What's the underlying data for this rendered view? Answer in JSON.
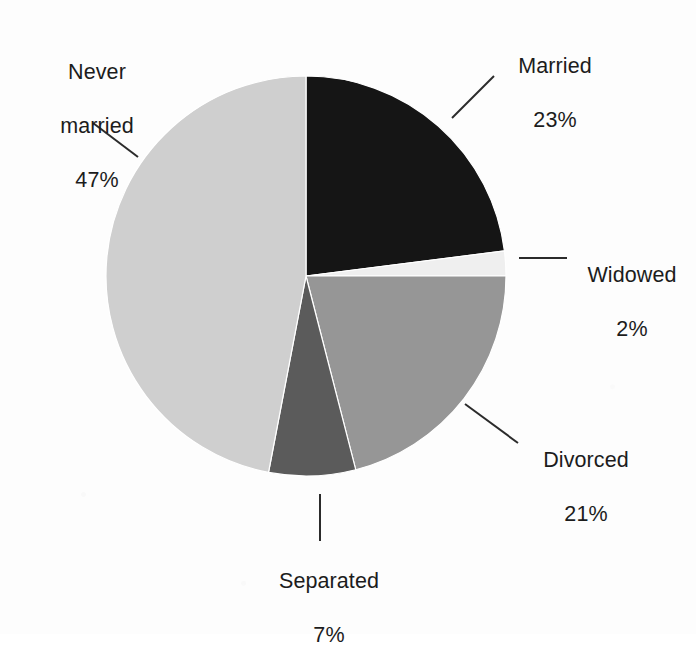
{
  "figure": {
    "background_color": "#fdfdfd",
    "text_color": "#1c1c1c",
    "leader_line_color": "#2b2b2b"
  },
  "chart_data": {
    "type": "pie",
    "title": "",
    "subtitle": "",
    "xlabel": "",
    "ylabel": "",
    "legend_position": "none",
    "labels_position": "outside-callouts",
    "grid": false,
    "start_angle_deg": 0,
    "direction": "clockwise",
    "center": {
      "x": 306,
      "y": 276
    },
    "radius": 200,
    "categories": [
      "Married",
      "Widowed",
      "Divorced",
      "Separated",
      "Never married"
    ],
    "values": [
      23,
      2,
      21,
      7,
      47
    ],
    "units": "%",
    "total": 100,
    "slices": [
      {
        "name": "Married",
        "label": "Married",
        "value": 23,
        "value_text": "23%",
        "color": "#151515",
        "start_deg": 0,
        "end_deg": 82.8,
        "leader": {
          "x1": 452,
          "y1": 118,
          "x2": 494,
          "y2": 76
        }
      },
      {
        "name": "Widowed",
        "label": "Widowed",
        "value": 2,
        "value_text": "2%",
        "color": "#efefef",
        "start_deg": 82.8,
        "end_deg": 90.0,
        "leader": {
          "x1": 519,
          "y1": 258,
          "x2": 567,
          "y2": 258
        }
      },
      {
        "name": "Divorced",
        "label": "Divorced",
        "value": 21,
        "value_text": "21%",
        "color": "#969696",
        "start_deg": 90.0,
        "end_deg": 165.6,
        "leader": {
          "x1": 465,
          "y1": 404,
          "x2": 518,
          "y2": 443
        }
      },
      {
        "name": "Separated",
        "label": "Separated",
        "value": 7,
        "value_text": "7%",
        "color": "#5b5b5b",
        "start_deg": 165.6,
        "end_deg": 190.8,
        "leader": {
          "x1": 320,
          "y1": 494,
          "x2": 320,
          "y2": 541
        }
      },
      {
        "name": "Never married",
        "label": "Never married",
        "label_line1": "Never",
        "label_line2": "married",
        "value": 47,
        "value_text": "47%",
        "color": "#cfcfcf",
        "start_deg": 190.8,
        "end_deg": 360.0,
        "leader": {
          "x1": 93,
          "y1": 123,
          "x2": 138,
          "y2": 157
        }
      }
    ]
  },
  "callouts": {
    "married": {
      "line1": "Married",
      "line2": "23%"
    },
    "widowed": {
      "line1": "Widowed",
      "line2": "2%"
    },
    "divorced": {
      "line1": "Divorced",
      "line2": "21%"
    },
    "separated": {
      "line1": "Separated",
      "line2": "7%"
    },
    "never_married": {
      "line1": "Never",
      "line2": "married",
      "line3": "47%"
    }
  }
}
